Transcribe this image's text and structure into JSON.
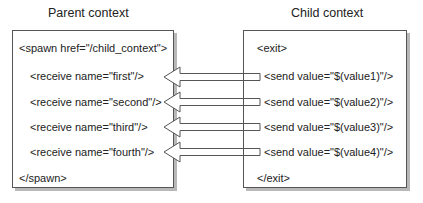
{
  "parent": {
    "title": "Parent context",
    "lines": [
      "<spawn href=\"/child_context\">",
      "<receive name=\"first\"/>",
      "<receive name=\"second\"/>",
      "<receive name=\"third\"/>",
      "<receive name=\"fourth\"/>",
      "</spawn>"
    ]
  },
  "child": {
    "title": "Child context",
    "lines": [
      "<exit>",
      "<send value=\"$(value1)\"/>",
      "<send value=\"$(value2)\"/>",
      "<send value=\"$(value3)\"/>",
      "<send value=\"$(value4)\"/>",
      "</exit>"
    ]
  },
  "arrows": [
    {
      "from": "send value1",
      "to": "receive first",
      "direction": "left"
    },
    {
      "from": "send value2",
      "to": "receive second",
      "direction": "left"
    },
    {
      "from": "send value3",
      "to": "receive third",
      "direction": "left"
    },
    {
      "from": "send value4",
      "to": "receive fourth",
      "direction": "left"
    }
  ],
  "colors": {
    "border": "#555555",
    "shadow": "#b8b8b8",
    "text": "#222222"
  }
}
